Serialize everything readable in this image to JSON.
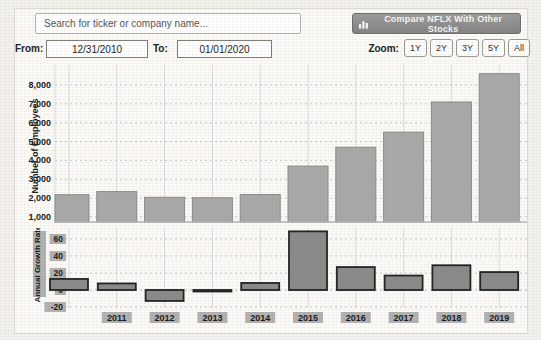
{
  "header": {
    "search_placeholder": "Search for ticker or company name...",
    "compare_button": "Compare NFLX With Other Stocks"
  },
  "controls": {
    "from_label": "From:",
    "from_value": "12/31/2010",
    "to_label": "To:",
    "to_value": "01/01/2020",
    "zoom_label": "Zoom:",
    "zoom_buttons": [
      "1Y",
      "2Y",
      "3Y",
      "5Y",
      "All"
    ]
  },
  "chart_data": [
    {
      "type": "bar",
      "ylabel": "Number of Employees",
      "categories": [
        "2010",
        "2011",
        "2012",
        "2013",
        "2014",
        "2015",
        "2016",
        "2017",
        "2018",
        "2019"
      ],
      "values": [
        2180,
        2348,
        2045,
        2022,
        2189,
        3700,
        4700,
        5500,
        7100,
        8600
      ],
      "ytick_values": [
        1000,
        2000,
        3000,
        4000,
        5000,
        6000,
        7000,
        8000
      ],
      "ytick_labels": [
        "1,000",
        "2,000",
        "3,000",
        "4,000",
        "5,000",
        "6,000",
        "7,000",
        "8,000"
      ],
      "ylim": [
        700,
        8900
      ],
      "grid": true,
      "x_labels_shown": false
    },
    {
      "type": "bar",
      "ylabel": "Annual Growth Rate",
      "categories": [
        "2010",
        "2011",
        "2012",
        "2013",
        "2014",
        "2015",
        "2016",
        "2017",
        "2018",
        "2019"
      ],
      "values": [
        13,
        7.7,
        -12.9,
        -1.1,
        8.3,
        69,
        27,
        17,
        29.1,
        21.1
      ],
      "ytick_values": [
        60,
        40,
        20,
        0,
        -20
      ],
      "ytick_labels": [
        "60",
        "40",
        "20",
        "0",
        "-20"
      ],
      "ylim": [
        -22,
        73
      ],
      "grid": true,
      "x_labels_shown": true,
      "visible_x_labels": [
        "2011",
        "2012",
        "2013",
        "2014",
        "2015",
        "2016",
        "2017",
        "2018",
        "2019"
      ]
    }
  ],
  "colors": {
    "page_bg": "#f3f2ee",
    "panel_bg": "#fbfaf7",
    "panel_border": "#dcdad3",
    "employees_bar_fill": "#a9a9a9",
    "employees_bar_stroke": "#8a8a8a",
    "growth_bar_fill": "#8a8a8a",
    "growth_bar_stroke": "#222222",
    "h_gridline": "#c9c9c9",
    "v_gridline": "#dcdcdc",
    "axis_line": "#b5b5b5",
    "label_chip_bg": "#b2b2b2",
    "text_dark": "#1a1a1a",
    "button_bg": "#8f8f8f",
    "button_text": "#f6f6f4"
  }
}
